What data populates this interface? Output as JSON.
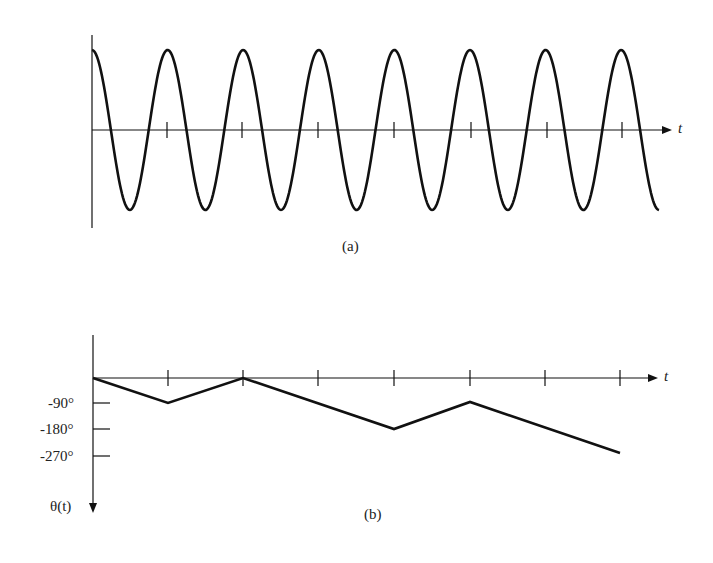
{
  "panel_a": {
    "caption": "(a)",
    "x_axis_label": "t",
    "description": "cosine carrier waveform with 7.5 cycles, unit-spaced tick marks on t axis"
  },
  "panel_b": {
    "caption": "(b)",
    "x_axis_label": "t",
    "y_axis_label": "θ(t)",
    "y_ticks": [
      "-90°",
      "-180°",
      "-270°"
    ]
  },
  "chart_data": [
    {
      "type": "line",
      "title": "(a)",
      "xlabel": "t",
      "ylabel": "",
      "cycles": 7.5,
      "x_ticks": [
        1,
        2,
        3,
        4,
        5,
        6,
        7
      ],
      "grid": false
    },
    {
      "type": "line",
      "title": "(b)",
      "xlabel": "t",
      "ylabel": "θ(t)",
      "x": [
        0,
        1,
        2,
        3,
        4,
        5,
        6,
        7
      ],
      "values": [
        0,
        -90,
        0,
        -90,
        -180,
        -90,
        -180,
        -270
      ],
      "yticks": [
        "-90°",
        "-180°",
        "-270°"
      ],
      "ylim": [
        -300,
        0
      ],
      "grid": false
    }
  ]
}
